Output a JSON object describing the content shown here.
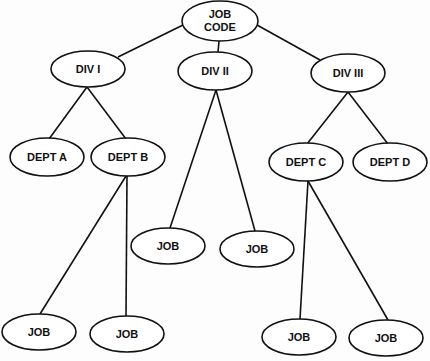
{
  "diagram": {
    "type": "hierarchy-tree",
    "nodes": [
      {
        "id": "root",
        "label": [
          "JOB",
          "CODE"
        ],
        "cx": 220,
        "cy": 21,
        "rx": 38,
        "ry": 20
      },
      {
        "id": "div1",
        "label": [
          "DIV  I"
        ],
        "cx": 88,
        "cy": 69,
        "rx": 37,
        "ry": 18
      },
      {
        "id": "div2",
        "label": [
          "DIV  II"
        ],
        "cx": 215,
        "cy": 71,
        "rx": 37,
        "ry": 19
      },
      {
        "id": "div3",
        "label": [
          "DIV   III"
        ],
        "cx": 348,
        "cy": 73,
        "rx": 37,
        "ry": 19
      },
      {
        "id": "deptA",
        "label": [
          "DEPT A"
        ],
        "cx": 47,
        "cy": 157,
        "rx": 37,
        "ry": 19
      },
      {
        "id": "deptB",
        "label": [
          "DEPT B"
        ],
        "cx": 128,
        "cy": 157,
        "rx": 37,
        "ry": 19
      },
      {
        "id": "deptC",
        "label": [
          "DEPT C"
        ],
        "cx": 306,
        "cy": 162,
        "rx": 37,
        "ry": 19
      },
      {
        "id": "deptD",
        "label": [
          "DEPT D"
        ],
        "cx": 390,
        "cy": 162,
        "rx": 37,
        "ry": 19
      },
      {
        "id": "job1",
        "label": [
          "JOB"
        ],
        "cx": 168,
        "cy": 246,
        "rx": 37,
        "ry": 18
      },
      {
        "id": "job2",
        "label": [
          "JOB"
        ],
        "cx": 257,
        "cy": 249,
        "rx": 37,
        "ry": 18
      },
      {
        "id": "job3",
        "label": [
          "JOB"
        ],
        "cx": 39,
        "cy": 332,
        "rx": 37,
        "ry": 18
      },
      {
        "id": "job4",
        "label": [
          "JOB"
        ],
        "cx": 127,
        "cy": 334,
        "rx": 37,
        "ry": 18
      },
      {
        "id": "job5",
        "label": [
          "JOB"
        ],
        "cx": 299,
        "cy": 337,
        "rx": 37,
        "ry": 18
      },
      {
        "id": "job6",
        "label": [
          "JOB"
        ],
        "cx": 386,
        "cy": 338,
        "rx": 37,
        "ry": 18
      }
    ],
    "edges": [
      {
        "from": "root",
        "to": "div1",
        "x1": 183,
        "y1": 25,
        "x2": 118,
        "y2": 57
      },
      {
        "from": "root",
        "to": "div2",
        "x1": 219,
        "y1": 41,
        "x2": 218,
        "y2": 52
      },
      {
        "from": "root",
        "to": "div3",
        "x1": 257,
        "y1": 25,
        "x2": 320,
        "y2": 60
      },
      {
        "from": "div1",
        "to": "deptA",
        "x1": 87,
        "y1": 87,
        "x2": 49,
        "y2": 139
      },
      {
        "from": "div1",
        "to": "deptB",
        "x1": 87,
        "y1": 87,
        "x2": 126,
        "y2": 139
      },
      {
        "from": "div2",
        "to": "job1",
        "x1": 216,
        "y1": 90,
        "x2": 170,
        "y2": 228
      },
      {
        "from": "div2",
        "to": "job2",
        "x1": 216,
        "y1": 90,
        "x2": 255,
        "y2": 231
      },
      {
        "from": "div3",
        "to": "deptC",
        "x1": 348,
        "y1": 92,
        "x2": 307,
        "y2": 144
      },
      {
        "from": "div3",
        "to": "deptD",
        "x1": 348,
        "y1": 92,
        "x2": 388,
        "y2": 144
      },
      {
        "from": "deptB",
        "to": "job3",
        "x1": 126,
        "y1": 176,
        "x2": 40,
        "y2": 314
      },
      {
        "from": "deptB",
        "to": "job4",
        "x1": 127,
        "y1": 176,
        "x2": 126,
        "y2": 316
      },
      {
        "from": "deptC",
        "to": "job5",
        "x1": 308,
        "y1": 181,
        "x2": 300,
        "y2": 319
      },
      {
        "from": "deptC",
        "to": "job6",
        "x1": 308,
        "y1": 181,
        "x2": 388,
        "y2": 320
      }
    ]
  }
}
